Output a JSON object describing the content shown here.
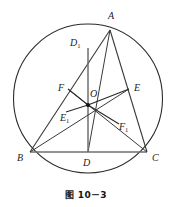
{
  "figure": {
    "caption": "图 10－3",
    "stroke_color": "#2b2b2b",
    "label_color": "#1b1b1b",
    "background": "#ffffff"
  },
  "circle": {
    "name": "circumcircle",
    "cx": 88,
    "cy": 98.5,
    "r": 74.5
  },
  "points": {
    "A": {
      "label": "A",
      "sub": "",
      "x": 110,
      "y": 30,
      "label_x": 108,
      "label_y": 11
    },
    "B": {
      "label": "B",
      "sub": "",
      "x": 30,
      "y": 152,
      "label_x": 17,
      "label_y": 153
    },
    "C": {
      "label": "C",
      "sub": "",
      "x": 147,
      "y": 152,
      "label_x": 152,
      "label_y": 153
    },
    "D": {
      "label": "D",
      "sub": "",
      "x": 88,
      "y": 152,
      "label_x": 83,
      "label_y": 158
    },
    "O": {
      "label": "O",
      "sub": "",
      "x": 88,
      "y": 105,
      "label_x": 90,
      "label_y": 89
    },
    "E": {
      "label": "E",
      "sub": "",
      "x": 129,
      "y": 89,
      "label_x": 134,
      "label_y": 83
    },
    "F": {
      "label": "F",
      "sub": "",
      "x": 68,
      "y": 89,
      "label_x": 58,
      "label_y": 83
    },
    "D1": {
      "label": "D",
      "sub": "1",
      "x": 88,
      "y": 48,
      "label_x": 70,
      "label_y": 38
    },
    "E1": {
      "label": "E",
      "sub": "1",
      "x": 66,
      "y": 112,
      "label_x": 60,
      "label_y": 113
    },
    "F1": {
      "label": "F",
      "sub": "1",
      "x": 119,
      "y": 124,
      "label_x": 119,
      "label_y": 122
    }
  },
  "segments": [
    {
      "name": "side-AB-chord",
      "from": "A",
      "to": "B"
    },
    {
      "name": "side-AC-chord",
      "from": "A",
      "to": "C"
    },
    {
      "name": "side-BC-chord",
      "from": "B",
      "to": "C"
    },
    {
      "name": "cevian-AD",
      "from": "A",
      "to": "D"
    },
    {
      "name": "median-line-D1D",
      "from": "D1",
      "to": "D"
    },
    {
      "name": "segment-OF",
      "from": "O",
      "to": "F"
    },
    {
      "name": "segment-OE",
      "from": "O",
      "to": "E"
    },
    {
      "name": "segment-OE1",
      "from": "O",
      "to": "E1"
    },
    {
      "name": "segment-OF1",
      "from": "O",
      "to": "F1"
    },
    {
      "name": "cevian-BE",
      "from": "B",
      "to": "E"
    },
    {
      "name": "cevian-CF",
      "from": "C",
      "to": "F"
    }
  ]
}
